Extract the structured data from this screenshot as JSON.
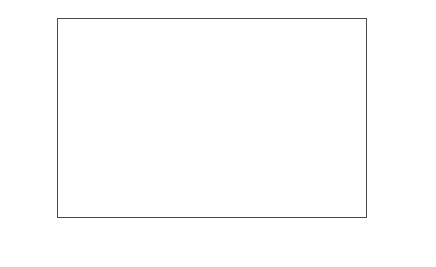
{
  "chart_data": {
    "type": "bar",
    "subtype": "stacked-bar",
    "title": "",
    "xlabel": "年份",
    "ylabel": "面积/万hm²",
    "ylabel_main": "面积/万hm",
    "ylabel_sup": "2",
    "ylim": [
      0,
      2000
    ],
    "yticks": [
      0,
      500,
      1000,
      1500,
      2000
    ],
    "ytick_labels": [
      "0",
      "500",
      "1000",
      "1500",
      "2000"
    ],
    "grid": false,
    "legend_position": "right",
    "categories": [
      "1980",
      "1988",
      "1990",
      "1992",
      "1994",
      "1996",
      "1998",
      "2000",
      "2002",
      "2004",
      "2006",
      "2008",
      "2010"
    ],
    "xtick_labels": [
      "1980",
      "1990",
      "1994",
      "1998",
      "2002",
      "2006",
      "2010"
    ],
    "xtick_indices": [
      0,
      2,
      4,
      6,
      8,
      10,
      12
    ],
    "series": [
      {
        "name": "设施蔬菜",
        "color": "#4e4e4e",
        "marker": "filled-square",
        "values": [
          5,
          10,
          25,
          35,
          60,
          100,
          155,
          200,
          235,
          270,
          310,
          360,
          495
        ]
      },
      {
        "name": "大田蔬菜",
        "color": "#ededed",
        "marker": "open-square",
        "values": [
          315,
          460,
          605,
          665,
          840,
          960,
          1085,
          1330,
          1525,
          1520,
          1540,
          1450,
          1435
        ]
      }
    ],
    "totals": [
      320,
      470,
      630,
      700,
      900,
      1060,
      1240,
      1530,
      1760,
      1790,
      1850,
      1810,
      1930
    ]
  },
  "legend": {
    "items": [
      {
        "label": "大田蔬菜",
        "swatch": "open-square"
      },
      {
        "label": "设施蔬菜",
        "swatch": "filled-square"
      }
    ]
  }
}
